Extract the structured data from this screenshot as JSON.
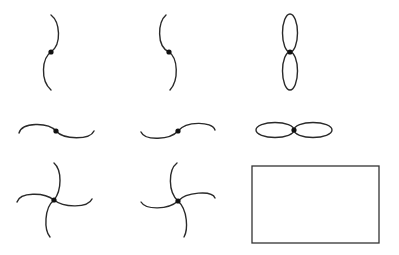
{
  "diagram": {
    "colors": {
      "stroke": "#2a2a2a",
      "vertex": "#111111",
      "background": "#ffffff"
    },
    "figures": [
      {
        "id": "vertical-s-curve",
        "row": 1,
        "col": 1,
        "kind": "two arcs meeting at vertex, S-shaped (upper bulges right, lower bulges left)"
      },
      {
        "id": "vertical-reverse-s-curve",
        "row": 1,
        "col": 2,
        "kind": "two arcs meeting at vertex, reverse S (upper bulges left, lower bulges right)"
      },
      {
        "id": "vertical-figure-eight",
        "row": 1,
        "col": 3,
        "kind": "two loops touching at vertex, stacked vertically"
      },
      {
        "id": "horizontal-s-curve",
        "row": 2,
        "col": 1,
        "kind": "two arcs meeting at vertex, horizontal S"
      },
      {
        "id": "horizontal-reverse-s-curve",
        "row": 2,
        "col": 2,
        "kind": "two arcs meeting at vertex, horizontal reverse S"
      },
      {
        "id": "horizontal-figure-eight",
        "row": 2,
        "col": 3,
        "kind": "two loops touching at vertex, side by side"
      },
      {
        "id": "pinwheel-clockwise",
        "row": 3,
        "col": 1,
        "kind": "four curved arms from vertex"
      },
      {
        "id": "pinwheel-counterclockwise",
        "row": 3,
        "col": 2,
        "kind": "four curved arms from vertex, mirrored"
      },
      {
        "id": "empty-rectangle",
        "row": 3,
        "col": 3,
        "kind": "rectangle outline"
      }
    ]
  }
}
